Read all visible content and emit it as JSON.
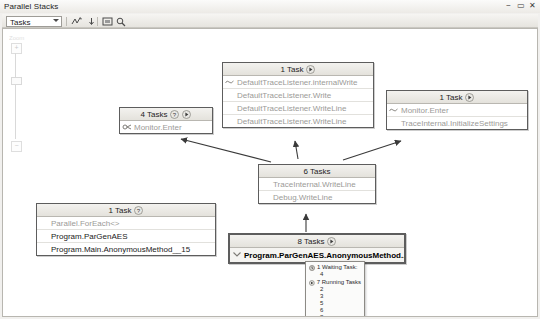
{
  "window": {
    "title": "Parallel Stacks",
    "controls": [
      {
        "name": "minimize",
        "glyph": "−"
      },
      {
        "name": "maximize",
        "glyph": "▭"
      },
      {
        "name": "close",
        "glyph": "✕"
      }
    ]
  },
  "toolbar": {
    "view_selector": {
      "value": "Tasks",
      "placeholder": "Tasks"
    },
    "buttons": [
      {
        "name": "toggle-method-view-button",
        "icon": "method-view-icon",
        "tooltip": "Toggle Method View"
      },
      {
        "name": "auto-scroll-button",
        "icon": "auto-scroll-icon",
        "tooltip": "Auto Scroll to Current Stack Frame"
      },
      {
        "name": "zoom-to-fit-button",
        "icon": "zoom-fit-icon",
        "tooltip": "Zoom to Fit"
      },
      {
        "name": "birds-eye-view-button",
        "icon": "birds-eye-icon",
        "tooltip": "Bird's Eye View"
      }
    ]
  },
  "canvas": {
    "zoom_control": {
      "zoom_in_label": "+",
      "zoom_out_label": "−",
      "label": "Zoom"
    },
    "nodes": [
      {
        "id": "node-defaulttracelistener",
        "header": "1 Task",
        "has_help_badge": false,
        "has_run_badge": true,
        "frames": [
          {
            "text": "DefaultTraceListener.internalWrite",
            "style": "gray",
            "icon": "wave-icon"
          },
          {
            "text": "DefaultTraceListener.Write",
            "style": "gray",
            "icon": "none"
          },
          {
            "text": "DefaultTraceListener.WriteLine",
            "style": "gray",
            "icon": "none"
          },
          {
            "text": "DefaultTraceListener.WriteLine",
            "style": "gray",
            "icon": "none"
          }
        ]
      },
      {
        "id": "node-monitor-enter-4",
        "header": "4 Tasks",
        "has_help_badge": true,
        "has_run_badge": true,
        "frames": [
          {
            "text": "Monitor.Enter",
            "style": "gray",
            "icon": "threads-icon"
          }
        ]
      },
      {
        "id": "node-traceinternal-init",
        "header": "1 Task",
        "has_help_badge": false,
        "has_run_badge": true,
        "frames": [
          {
            "text": "Monitor.Enter",
            "style": "gray",
            "icon": "wave-icon"
          },
          {
            "text": "TraceInternal.InitializeSettings",
            "style": "gray",
            "icon": "none"
          }
        ]
      },
      {
        "id": "node-traceinternal-writeline",
        "header": "6 Tasks",
        "has_help_badge": false,
        "has_run_badge": false,
        "frames": [
          {
            "text": "TraceInternal.WriteLine",
            "style": "gray",
            "icon": "none"
          },
          {
            "text": "Debug.WriteLine",
            "style": "gray",
            "icon": "none"
          }
        ]
      },
      {
        "id": "node-parallel-foreach",
        "header": "1 Task",
        "has_help_badge": true,
        "has_run_badge": false,
        "frames": [
          {
            "text": "Parallel.ForEach<>",
            "style": "gray",
            "icon": "none"
          },
          {
            "text": "Program.ParGenAES",
            "style": "dark",
            "icon": "none"
          },
          {
            "text": "Program.Main.AnonymousMethod__15",
            "style": "dark",
            "icon": "none"
          }
        ]
      },
      {
        "id": "node-pargenaes-anon",
        "header": "8 Tasks",
        "has_help_badge": false,
        "has_run_badge": true,
        "frames": [
          {
            "text": "Program.ParGenAES.AnonymousMethod...",
            "style": "bold",
            "icon": "chevron-down-icon"
          }
        ]
      }
    ],
    "tooltip": {
      "groups": [
        {
          "icon": "waiting-task-icon",
          "label": "1 Waiting Task:",
          "ids": [
            "4"
          ]
        },
        {
          "icon": "running-task-icon",
          "label": "7 Running Tasks",
          "ids": [
            "2",
            "3",
            "5",
            "6",
            "8",
            "9",
            "10"
          ]
        }
      ]
    }
  },
  "colors": {
    "canvas_bg": "#ffffff",
    "node_border": "#5d5d5d",
    "header_grad_top": "#f3f2ef",
    "header_grad_bottom": "#e4e2dc",
    "frame_gray_text": "#9b9a97",
    "frame_dark_text": "#1a1a1a",
    "connector": "#3a3a3a"
  }
}
